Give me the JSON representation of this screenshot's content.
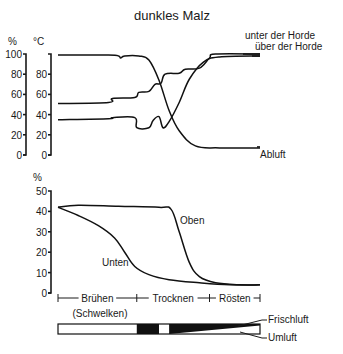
{
  "title": "dunkles Malz",
  "colors": {
    "ink": "#111111",
    "background": "#ffffff"
  },
  "chart_data": [
    {
      "type": "line",
      "title": "dunkles Malz",
      "axes": [
        {
          "label": "%",
          "ticks": [
            0,
            20,
            40,
            60,
            80,
            100
          ],
          "ylim": [
            0,
            100
          ],
          "meaning": "relative Luftfeuchte"
        },
        {
          "label": "°C",
          "ticks": [
            0,
            20,
            40,
            60,
            80
          ],
          "ylim": [
            0,
            100
          ],
          "meaning": "Temperatur"
        }
      ],
      "x_unit": "phase progress (0 = Beginn Brühen, 1 = Ende Rösten)",
      "series": [
        {
          "name": "Abluft",
          "axis": "%",
          "x": [
            0.0,
            0.25,
            0.3,
            0.31,
            0.33,
            0.4,
            0.45,
            0.5,
            0.55,
            0.6,
            0.68,
            0.8,
            1.0
          ],
          "values": [
            100,
            100,
            99,
            97,
            99,
            99,
            95,
            75,
            45,
            25,
            10,
            8,
            8
          ]
        },
        {
          "name": "unter der Horde",
          "axis": "°C",
          "x": [
            0.0,
            0.25,
            0.27,
            0.38,
            0.4,
            0.45,
            0.48,
            0.51,
            0.53,
            0.6,
            0.63,
            0.7,
            0.75,
            0.78,
            1.0
          ],
          "values": [
            51,
            52,
            56,
            57,
            62,
            63,
            70,
            71,
            80,
            81,
            85,
            86,
            96,
            100,
            100
          ]
        },
        {
          "name": "über der Horde",
          "axis": "°C",
          "x": [
            0.0,
            0.25,
            0.27,
            0.38,
            0.39,
            0.45,
            0.47,
            0.5,
            0.52,
            0.55,
            0.6,
            0.65,
            0.72,
            0.8,
            1.0
          ],
          "values": [
            35,
            36,
            37,
            37,
            27,
            27,
            34,
            38,
            27,
            33,
            52,
            75,
            92,
            97,
            98
          ]
        }
      ],
      "labels": [
        "unter der Horde",
        "über der Horde",
        "Abluft"
      ]
    },
    {
      "type": "line",
      "axes": [
        {
          "label": "%",
          "ticks": [
            0,
            10,
            20,
            30,
            40,
            50
          ],
          "ylim": [
            0,
            50
          ],
          "meaning": "Wassergehalt"
        }
      ],
      "series": [
        {
          "name": "Oben",
          "x": [
            0.0,
            0.1,
            0.3,
            0.5,
            0.56,
            0.6,
            0.65,
            0.7,
            0.78,
            0.9,
            1.0
          ],
          "values": [
            42,
            43,
            42.5,
            42,
            41,
            30,
            15,
            8,
            5,
            4,
            4
          ]
        },
        {
          "name": "Unten",
          "x": [
            0.0,
            0.1,
            0.2,
            0.28,
            0.33,
            0.38,
            0.45,
            0.55,
            0.7,
            0.85,
            1.0
          ],
          "values": [
            42,
            38,
            33,
            27,
            20,
            13,
            9,
            6.5,
            5,
            4,
            4
          ]
        }
      ],
      "labels": [
        "Oben",
        "Unten"
      ]
    }
  ],
  "phases": [
    {
      "label": "Brühen",
      "sub": "(Schwelken)",
      "start": 0.0,
      "end": 0.39
    },
    {
      "label": "Trocknen",
      "start": 0.39,
      "end": 0.75
    },
    {
      "label": "Rösten",
      "start": 0.75,
      "end": 1.0
    }
  ],
  "air_bar": {
    "labels": {
      "fresh": "Frischluft",
      "recirc": "Umluft"
    },
    "segments": [
      {
        "from": 0.0,
        "to": 0.39,
        "fill": "white"
      },
      {
        "from": 0.39,
        "to": 0.5,
        "fill": "black"
      },
      {
        "from": 0.5,
        "to": 0.55,
        "fill": "white"
      },
      {
        "from": 0.55,
        "to": 1.0,
        "fill": "wedge"
      }
    ]
  }
}
